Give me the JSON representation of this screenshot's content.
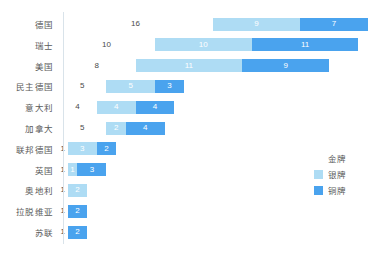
{
  "chart_data": {
    "type": "bar",
    "orientation": "horizontal",
    "stacked": true,
    "title": "",
    "subtitle": "",
    "xlabel": "",
    "ylabel": "",
    "grid": false,
    "xlim": [
      0,
      32
    ],
    "legend_position": "right",
    "categories": [
      "德国",
      "瑞士",
      "美国",
      "民主德国",
      "意大利",
      "加拿大",
      "联邦德国",
      "英国",
      "奥地利",
      "拉脱维亚",
      "苏联"
    ],
    "series": [
      {
        "name": "金牌",
        "color": "#ffffff",
        "values": [
          16,
          10,
          8,
          5,
          4,
          5,
          1,
          1,
          1,
          1,
          1
        ]
      },
      {
        "name": "银牌",
        "color": "#aedcf4",
        "values": [
          9,
          10,
          11,
          5,
          4,
          2,
          3,
          1,
          2,
          0,
          0
        ]
      },
      {
        "name": "铜牌",
        "color": "#4aa3ee",
        "values": [
          7,
          11,
          9,
          3,
          4,
          4,
          2,
          3,
          0,
          2,
          2
        ]
      }
    ]
  },
  "legend": {
    "items": [
      {
        "label": "金牌",
        "color": "#ffffff"
      },
      {
        "label": "银牌",
        "color": "#aedcf4"
      },
      {
        "label": "铜牌",
        "color": "#4aa3ee"
      }
    ]
  },
  "axis": {
    "baseline_color": "#d9e3ea"
  }
}
